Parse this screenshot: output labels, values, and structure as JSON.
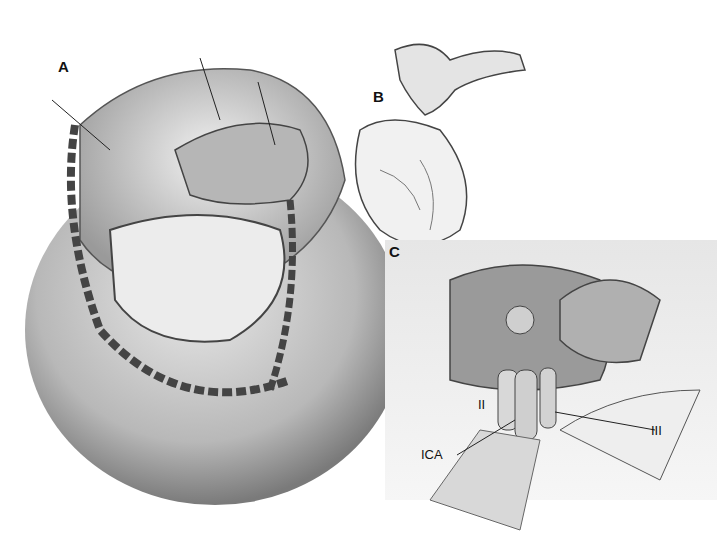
{
  "figure": {
    "panels": [
      {
        "id": "A",
        "label": "A",
        "description": "Skull with craniotomy bone flap, retracted brain lobes and exposed dura"
      },
      {
        "id": "B",
        "label": "B",
        "description": "Removed bone flap with orbital rim piece"
      },
      {
        "id": "C",
        "label": "C",
        "description": "Surgical exposure view of optic nerve, carotid artery and oculomotor nerve"
      }
    ],
    "annotations": {
      "optic_nerve": "II",
      "carotid": "ICA",
      "oculomotor": "III"
    },
    "signatures": [
      "Hines",
      "Hines / A.S. Baker"
    ]
  }
}
